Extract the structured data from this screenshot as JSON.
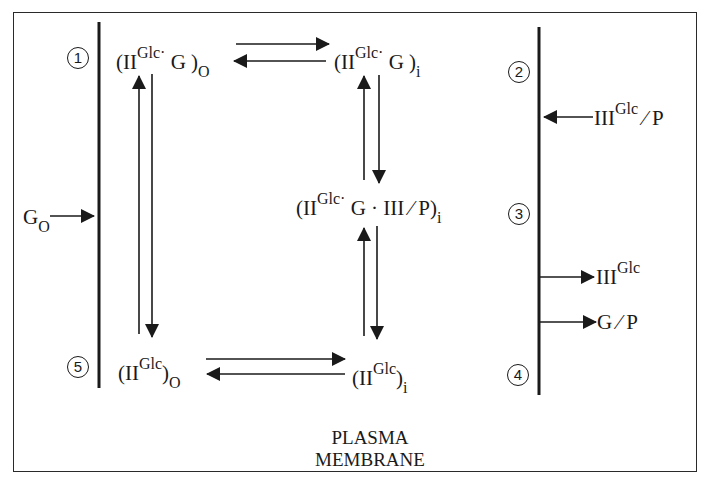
{
  "diagram": {
    "type": "reaction-scheme",
    "caption": {
      "line1": "PLASMA",
      "line2": "MEMBRANE"
    },
    "step_markers": [
      "1",
      "2",
      "3",
      "4",
      "5"
    ],
    "species": {
      "IIGlcG_o": {
        "base": "(II",
        "sup": "Glc",
        "dot": "·",
        "rest": " G )",
        "sub": "O"
      },
      "IIGlcG_i": {
        "base": "(II",
        "sup": "Glc",
        "dot": "·",
        "rest": " G )",
        "sub": "i"
      },
      "complex_i": {
        "base": "(II",
        "sup": "Glc",
        "dot": "·",
        "rest": " G ·  III ⁄ P)",
        "sub": "i"
      },
      "IIGlc_o": {
        "base": "(II",
        "sup": "Glc",
        "rest": ")",
        "sub": "O"
      },
      "IIGlc_i": {
        "base": "(II",
        "sup": "Glc",
        "rest": ")",
        "sub": "i"
      },
      "G_o": {
        "base": "G",
        "sub": "O"
      },
      "IIIGlcP": {
        "base": "III",
        "sup": "Glc",
        "rest": " ⁄ P"
      },
      "IIIGlc": {
        "base": "III",
        "sup": "Glc"
      },
      "GP": {
        "base": "G ⁄ P"
      }
    },
    "arrows": [
      {
        "from": "G_o",
        "to": "left-membrane",
        "direction": "right"
      },
      {
        "from": "IIGlcG_o",
        "to": "IIGlcG_i",
        "reversible": true
      },
      {
        "from": "IIGlcG_i",
        "to": "complex_i",
        "reversible": true
      },
      {
        "from": "complex_i",
        "to": "IIGlc_i",
        "reversible": true
      },
      {
        "from": "IIGlc_i",
        "to": "IIGlc_o",
        "reversible": true
      },
      {
        "from": "IIGlc_o",
        "to": "IIGlcG_o",
        "reversible": true
      },
      {
        "from": "IIIGlcP",
        "to": "right-membrane",
        "direction": "left"
      },
      {
        "from": "right-membrane",
        "to": "IIIGlc",
        "direction": "right"
      },
      {
        "from": "right-membrane",
        "to": "GP",
        "direction": "right"
      }
    ],
    "colors": {
      "ink": "#1a1a1a",
      "background": "#ffffff"
    }
  }
}
